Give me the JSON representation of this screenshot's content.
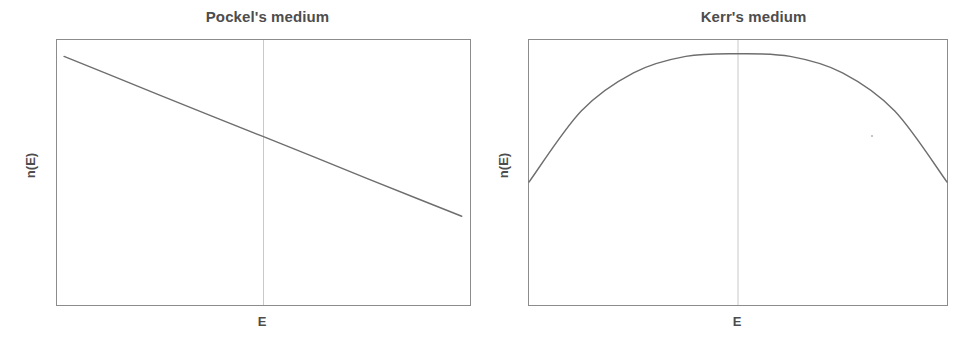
{
  "figure": {
    "width": 978,
    "height": 345,
    "background": "#ffffff",
    "line_color": "#6e6e6e",
    "axis_color": "#8c8c8c",
    "text_color": "#4d4d4d",
    "gridline_color": "#c9c9c9"
  },
  "panels": [
    {
      "id": "pockel",
      "title": "Pockel's medium",
      "xlabel": "E",
      "ylabel": "n(E)"
    },
    {
      "id": "kerr",
      "title": "Kerr's medium",
      "xlabel": "E",
      "ylabel": "n(E)"
    }
  ],
  "chart_data": [
    {
      "type": "line",
      "title": "Pockel's medium",
      "xlabel": "E",
      "ylabel": "n(E)",
      "grid": false,
      "legend": "none",
      "axis_ticks": "none",
      "xlim": [
        0,
        1
      ],
      "ylim": [
        0,
        1
      ],
      "annotations": [
        {
          "kind": "vertical-gridline",
          "x": 0.5,
          "label": "E"
        }
      ],
      "series": [
        {
          "name": "n(E) Pockels (linear electro-optic)",
          "shape": "straight decreasing line",
          "x": [
            0.017,
            0.125,
            0.25,
            0.375,
            0.5,
            0.625,
            0.75,
            0.875,
            0.98
          ],
          "y": [
            0.938,
            0.87,
            0.791,
            0.713,
            0.635,
            0.557,
            0.478,
            0.4,
            0.335
          ]
        }
      ]
    },
    {
      "type": "line",
      "title": "Kerr's medium",
      "xlabel": "E",
      "ylabel": "n(E)",
      "grid": false,
      "legend": "none",
      "axis_ticks": "none",
      "xlim": [
        0,
        1
      ],
      "ylim": [
        0,
        1
      ],
      "annotations": [
        {
          "kind": "vertical-gridline",
          "x": 0.5,
          "label": "E"
        }
      ],
      "series": [
        {
          "name": "n(E) Kerr (quadratic electro-optic)",
          "shape": "downward parabola peaking at center",
          "x": [
            0.0,
            0.125,
            0.25,
            0.375,
            0.5,
            0.625,
            0.75,
            0.875,
            1.0
          ],
          "y": [
            0.464,
            0.732,
            0.876,
            0.938,
            0.948,
            0.938,
            0.876,
            0.732,
            0.464
          ]
        }
      ]
    }
  ]
}
